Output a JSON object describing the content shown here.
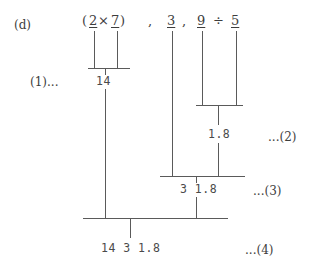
{
  "figure": {
    "part_label": "(d)",
    "background_color": "#ffffff",
    "line_color": "#5a5a5a",
    "text_color": "#3d3d3d"
  },
  "expression": {
    "full_text": "(2 × 7) , 3 , 9 ÷ 5",
    "open_paren": "(",
    "operand_a": "2",
    "times_sign": "×",
    "operand_b": "7",
    "close_paren": ")",
    "comma_1": ",",
    "operand_c": "3",
    "comma_2": ",",
    "operand_d": "9",
    "divide_sign": "÷",
    "operand_e": "5"
  },
  "steps": {
    "step1_marker": "(1)...",
    "step1_result": "14",
    "step2_marker": "...(2)",
    "step2_result": "1.8",
    "step3_marker": "...(3)",
    "step3_result": "3 1.8",
    "step4_marker": "...(4)",
    "step4_result": "14 3 1.8"
  }
}
